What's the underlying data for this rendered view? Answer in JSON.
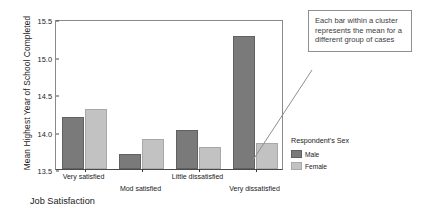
{
  "chart_data": {
    "type": "bar",
    "title": "",
    "xlabel": "Job Satisfaction",
    "ylabel": "Mean Highest Year of School Completed",
    "categories": [
      "Very satisfied",
      "Mod satisfied",
      "Little dissatisfied",
      "Very dissatisfied"
    ],
    "series": [
      {
        "name": "Male",
        "color": "#7a7a7a",
        "values": [
          14.19,
          13.7,
          14.02,
          15.28
        ]
      },
      {
        "name": "Female",
        "color": "#c2c2c2",
        "values": [
          14.3,
          13.9,
          13.8,
          13.85
        ]
      }
    ],
    "ylim": [
      13.5,
      15.5
    ],
    "yticks": [
      "13.5",
      "14.0",
      "14.5",
      "15.0",
      "15.5"
    ],
    "ytick_values": [
      13.5,
      14.0,
      14.5,
      15.0,
      15.5
    ],
    "grid": false,
    "legend_position": "right"
  },
  "legend": {
    "title": "Respondent's Sex",
    "entries": [
      {
        "label": "Male",
        "color": "#7a7a7a"
      },
      {
        "label": "Female",
        "color": "#c2c2c2"
      }
    ]
  },
  "callout": {
    "text": "Each bar within a cluster represents the mean for a different group of cases"
  }
}
